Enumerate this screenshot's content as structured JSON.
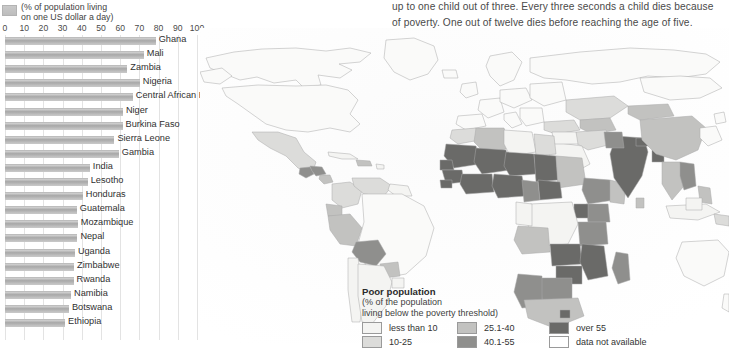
{
  "intro": {
    "lines": [
      "to 40 per cent of the population living in poverty and rates",
      "up to one child out of three. Every three seconds a child dies because",
      "of poverty. One out of twelve dies before reaching the age of five."
    ]
  },
  "chart_data": {
    "type": "bar",
    "title": "",
    "subtitle_lines": [
      "(% of population living",
      "on one US dollar a day)"
    ],
    "xlabel": "",
    "ylabel": "",
    "xlim": [
      0,
      100
    ],
    "ticks": [
      0,
      10,
      20,
      30,
      40,
      50,
      60,
      70,
      80,
      90,
      100
    ],
    "grid": true,
    "orientation": "horizontal",
    "legend_swatch_color": "#bdbdbd",
    "categories": [
      "Ghana",
      "Mali",
      "Zambia",
      "Nigeria",
      "Central African Rep.",
      "Niger",
      "Burkina Faso",
      "Sierra Leone",
      "Gambia",
      "India",
      "Lesotho",
      "Honduras",
      "Guatemala",
      "Mozambique",
      "Nepal",
      "Uganda",
      "Zimbabwe",
      "Rwanda",
      "Namibia",
      "Botswana",
      "Ethiopia"
    ],
    "values": [
      78.5,
      72.3,
      63.7,
      70.2,
      66.6,
      61.4,
      61.2,
      57.0,
      59.3,
      44.2,
      43.1,
      40.5,
      37.4,
      37.9,
      37.7,
      36.4,
      36.0,
      35.7,
      34.4,
      33.3,
      31.3
    ]
  },
  "map": {
    "legend": {
      "title": "Poor population",
      "subtitle_lines": [
        "(% of the population",
        "living below the poverty threshold)"
      ],
      "items": [
        {
          "label": "less than 10",
          "color": "#f4f4f2"
        },
        {
          "label": "10-25",
          "color": "#dcdcda"
        },
        {
          "label": "25.1-40",
          "color": "#c2c2c0"
        },
        {
          "label": "40.1-55",
          "color": "#8f8f8d"
        },
        {
          "label": "over 55",
          "color": "#6a6a68"
        },
        {
          "label": "data not available",
          "color": "#ffffff"
        }
      ]
    }
  }
}
